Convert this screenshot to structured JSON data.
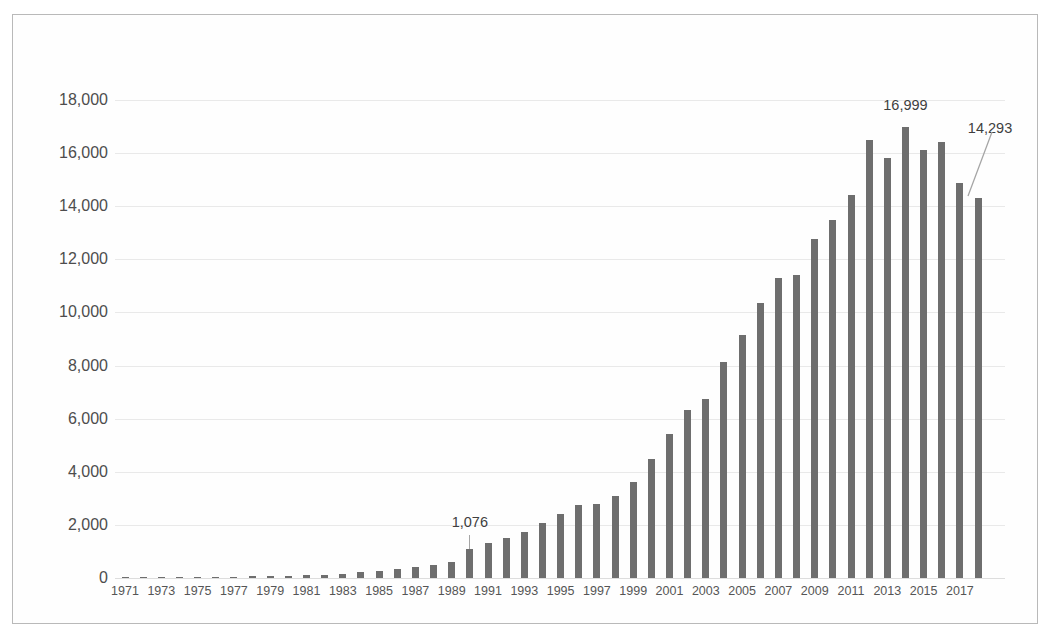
{
  "chart_data": {
    "type": "bar",
    "title": "",
    "subtitle": "",
    "xlabel": "",
    "ylabel": "",
    "ylim": [
      0,
      18000
    ],
    "y_ticks": [
      "0",
      "2,000",
      "4,000",
      "6,000",
      "8,000",
      "10,000",
      "12,000",
      "14,000",
      "16,000",
      "18,000"
    ],
    "y_tick_values": [
      0,
      2000,
      4000,
      6000,
      8000,
      10000,
      12000,
      14000,
      16000,
      18000
    ],
    "grid": true,
    "legend": null,
    "legend_position": "none",
    "bar_color": "#6e6e6e",
    "gridline_color": "#e9e9e9",
    "categories": [
      "1971",
      "1972",
      "1973",
      "1974",
      "1975",
      "1976",
      "1977",
      "1978",
      "1979",
      "1980",
      "1981",
      "1982",
      "1983",
      "1984",
      "1985",
      "1986",
      "1987",
      "1988",
      "1989",
      "1990",
      "1991",
      "1992",
      "1993",
      "1994",
      "1995",
      "1996",
      "1997",
      "1998",
      "1999",
      "2000",
      "2001",
      "2002",
      "2003",
      "2004",
      "2005",
      "2006",
      "2007",
      "2008",
      "2009",
      "2010",
      "2011",
      "2012",
      "2013",
      "2014",
      "2015",
      "2016",
      "2017",
      "2018"
    ],
    "x_tick_labels": [
      "1971",
      "1973",
      "1975",
      "1977",
      "1979",
      "1981",
      "1983",
      "1985",
      "1987",
      "1989",
      "1991",
      "1993",
      "1995",
      "1997",
      "1999",
      "2001",
      "2003",
      "2005",
      "2007",
      "2009",
      "2011",
      "2013",
      "2015",
      "2017"
    ],
    "values": [
      20,
      25,
      30,
      35,
      40,
      45,
      55,
      65,
      75,
      85,
      95,
      110,
      150,
      215,
      280,
      330,
      400,
      480,
      620,
      1076,
      1330,
      1500,
      1720,
      2060,
      2420,
      2750,
      2800,
      3090,
      3600,
      4500,
      5440,
      6340,
      6740,
      8120,
      9140,
      10360,
      11300,
      11400,
      12780,
      13500,
      14420,
      16490,
      15830,
      16999,
      16130,
      16430,
      14870,
      14293
    ],
    "annotations": [
      {
        "label": "1,076",
        "year": "1990",
        "value": 1076
      },
      {
        "label": "16,999",
        "year": "2014",
        "value": 16999
      },
      {
        "label": "14,293",
        "year": "2018",
        "value": 14293
      }
    ]
  }
}
